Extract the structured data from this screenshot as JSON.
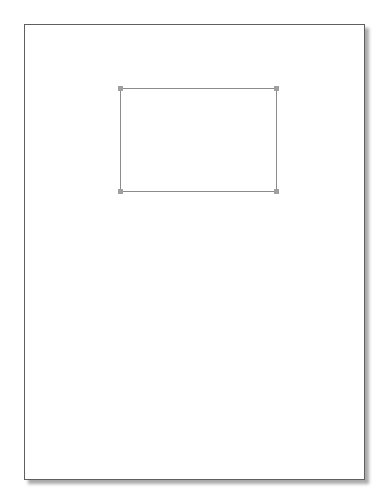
{
  "workspace": {
    "background_color": "#ffffff"
  },
  "page": {
    "fill_color": "#ffffff",
    "border_color": "#5f5f5f",
    "shadow_color": "#7d7d7d",
    "shadow_offset": "4px 4px"
  },
  "shape": {
    "type": "rectangle",
    "fill": "none",
    "stroke_color": "#8c8c8c",
    "selected": true,
    "selection_handles": {
      "color": "#9f9f9f",
      "positions": [
        "top-left",
        "top-right",
        "bottom-left",
        "bottom-right"
      ]
    }
  }
}
